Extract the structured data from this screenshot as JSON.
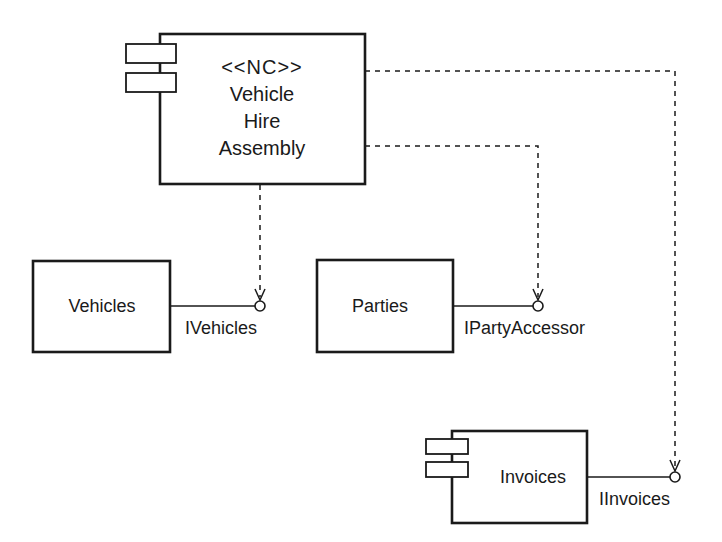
{
  "diagram": {
    "type": "UML component diagram",
    "colors": {
      "stroke": "#1a1a1a",
      "background": "#ffffff"
    },
    "components": {
      "assembly": {
        "stereotype": "<<NC>>",
        "name_lines": [
          "Vehicle",
          "Hire",
          "Assembly"
        ],
        "has_component_icon": true
      },
      "vehicles": {
        "name": "Vehicles",
        "has_component_icon": false
      },
      "parties": {
        "name": "Parties",
        "has_component_icon": false
      },
      "invoices": {
        "name": "Invoices",
        "has_component_icon": true
      }
    },
    "interfaces": {
      "ivehicles": {
        "label": "IVehicles",
        "provided_by": "Vehicles"
      },
      "ipartyaccessor": {
        "label": "IPartyAccessor",
        "provided_by": "Parties"
      },
      "iinvoices": {
        "label": "IInvoices",
        "provided_by": "Invoices"
      }
    },
    "dependencies": [
      {
        "from": "Vehicle Hire Assembly",
        "to": "IVehicles"
      },
      {
        "from": "Vehicle Hire Assembly",
        "to": "IPartyAccessor"
      },
      {
        "from": "Vehicle Hire Assembly",
        "to": "IInvoices"
      }
    ]
  }
}
